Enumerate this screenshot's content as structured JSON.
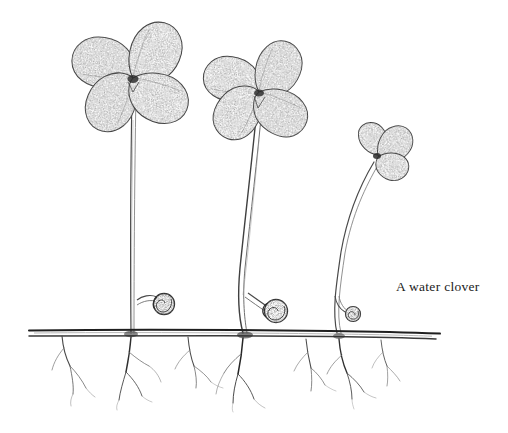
{
  "figure": {
    "kind": "botanical-line-drawing",
    "medium": "pencil stipple and ink line",
    "caption": "A water clover",
    "background_color": "#ffffff",
    "ink_color": "#2b2b2b",
    "stipple_color": "#6b6b6b",
    "width": 508,
    "height": 433
  },
  "subject": {
    "common_name": "water clover",
    "description": "Three water clover fronds of decreasing size rising from a horizontal creeping rhizome, with three coiled young fiddleheads and tufts of fibrous roots below the rhizome."
  },
  "rhizome": {
    "label": "rhizome",
    "y": 333,
    "x_start": 28,
    "x_end": 441,
    "line_count": 2
  },
  "plants": [
    {
      "label": "plant-large",
      "leaflet_count": 4,
      "stem_base_x": 131,
      "stem_top_x": 133,
      "stem_top_y": 92,
      "leaf_center_x": 133,
      "leaf_center_y": 78,
      "leaf_radius": 46,
      "height_px": 241
    },
    {
      "label": "plant-medium",
      "leaflet_count": 4,
      "stem_base_x": 243,
      "stem_top_x": 258,
      "stem_top_y": 108,
      "leaf_center_x": 259,
      "leaf_center_y": 92,
      "leaf_radius": 41,
      "height_px": 225
    },
    {
      "label": "plant-small",
      "leaflet_count": 3,
      "stem_base_x": 337,
      "stem_top_x": 375,
      "stem_top_y": 160,
      "leaf_center_x": 380,
      "leaf_center_y": 152,
      "leaf_radius": 22,
      "height_px": 173
    }
  ],
  "fiddleheads": [
    {
      "label": "fiddlehead-left",
      "cx": 163,
      "cy": 304,
      "r": 11
    },
    {
      "label": "fiddlehead-middle",
      "cx": 274,
      "cy": 310,
      "r": 12
    },
    {
      "label": "fiddlehead-right",
      "cx": 352,
      "cy": 314,
      "r": 8
    }
  ],
  "root_clusters": [
    {
      "label": "root-cluster-1",
      "x": 62,
      "depth": 62
    },
    {
      "label": "root-cluster-2",
      "x": 131,
      "depth": 70
    },
    {
      "label": "root-cluster-3",
      "x": 186,
      "depth": 52
    },
    {
      "label": "root-cluster-4",
      "x": 243,
      "depth": 78
    },
    {
      "label": "root-cluster-5",
      "x": 308,
      "depth": 58
    },
    {
      "label": "root-cluster-6",
      "x": 337,
      "depth": 70
    },
    {
      "label": "root-cluster-7",
      "x": 381,
      "depth": 50
    }
  ]
}
